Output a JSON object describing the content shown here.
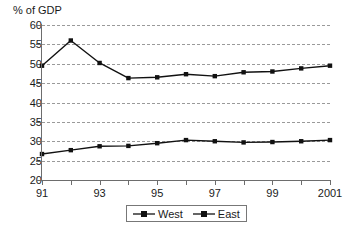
{
  "chart_data": {
    "type": "line",
    "title": "",
    "subtitle": "",
    "xlabel": "",
    "ylabel": "% of GDP",
    "ylim": [
      20,
      60
    ],
    "xlim": [
      1991,
      2001
    ],
    "yticks": [
      20,
      25,
      30,
      35,
      40,
      45,
      50,
      55,
      60
    ],
    "grid": true,
    "grid_style": "dashed-horizontal",
    "legend_position": "bottom-center",
    "x": [
      1991,
      1992,
      1993,
      1994,
      1995,
      1996,
      1997,
      1998,
      1999,
      2000,
      2001
    ],
    "categories": [
      "91",
      "92",
      "93",
      "94",
      "95",
      "96",
      "97",
      "98",
      "99",
      "2000",
      "2001"
    ],
    "xtick_labels": [
      "91",
      "",
      "93",
      "",
      "95",
      "",
      "97",
      "",
      "99",
      "",
      "2001"
    ],
    "series": [
      {
        "name": "West",
        "marker": "square",
        "color": "#111111",
        "values": [
          26.7,
          27.7,
          28.7,
          28.8,
          29.5,
          30.3,
          30.0,
          29.7,
          29.8,
          30.0,
          30.3
        ]
      },
      {
        "name": "East",
        "marker": "square",
        "color": "#111111",
        "values": [
          49.5,
          56.0,
          50.2,
          46.3,
          46.5,
          47.3,
          46.8,
          47.8,
          48.0,
          48.8,
          49.5
        ]
      }
    ]
  },
  "axis": {
    "y_title": "% of GDP"
  },
  "legend": {
    "items": [
      {
        "label": "West"
      },
      {
        "label": "East"
      }
    ]
  }
}
